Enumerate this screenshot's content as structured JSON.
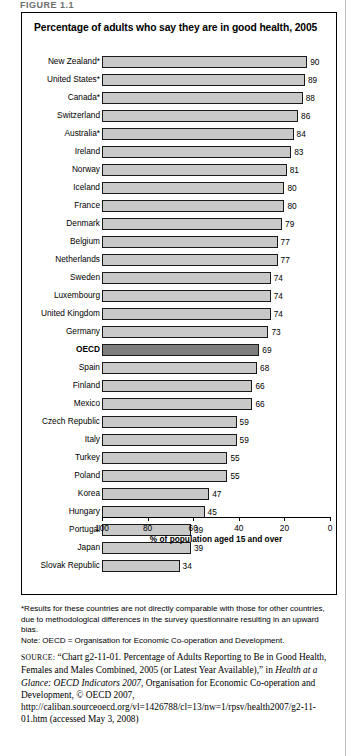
{
  "figure_label": "FIGURE 1.1",
  "panel": {
    "title": "Percentage of adults who say they are in good health, 2005"
  },
  "notes": {
    "asterisk_note": "*Results for these countries are not directly comparable with those for other countries, due to methodological differences in the survey questionnaire resulting in an upward bias.",
    "oecd_note": "Note: OECD = Organisation for Economic Co-operation and Development."
  },
  "source": {
    "lead": "SOURCE:",
    "part1": " “Chart g2-11-01. Percentage of Adults Reporting to Be in Good Health, Females and Males Combined, 2005 (or Latest Year Available),” in ",
    "italic_title": "Health at a Glance: OECD Indicators 2007",
    "part2": ", Organisation for Economic Co-operation and Development, © OECD 2007, http://caliban.sourceoecd.org/vl=1426788/cl=13/nw=1/rpsv/health2007/g2-11-01.htm (accessed May 3, 2008)"
  },
  "chart_data": {
    "type": "bar",
    "orientation": "horizontal",
    "title": "Percentage of adults who say they are in good health, 2005",
    "xlabel": "% of population aged 15 and over",
    "ylabel": "",
    "xlim": [
      100,
      0
    ],
    "axis_reversed": true,
    "ticks": [
      100,
      80,
      60,
      40,
      20,
      0
    ],
    "grid": false,
    "legend": "none",
    "highlight_category": "OECD",
    "colors": {
      "bar": "#c9c9c9",
      "bar_highlight": "#7d7d7d",
      "bar_outline": "#1a1a1a"
    },
    "categories": [
      "New Zealand*",
      "United States*",
      "Canada*",
      "Switzerland",
      "Australia*",
      "Ireland",
      "Norway",
      "Iceland",
      "France",
      "Denmark",
      "Belgium",
      "Netherlands",
      "Sweden",
      "Luxembourg",
      "United Kingdom",
      "Germany",
      "OECD",
      "Spain",
      "Finland",
      "Mexico",
      "Czech Republic",
      "Italy",
      "Turkey",
      "Poland",
      "Korea",
      "Hungary",
      "Portugal",
      "Japan",
      "Slovak Republic"
    ],
    "values": [
      90,
      89,
      88,
      86,
      84,
      83,
      81,
      80,
      80,
      79,
      77,
      77,
      74,
      74,
      74,
      73,
      69,
      68,
      66,
      66,
      59,
      59,
      55,
      55,
      47,
      45,
      39,
      39,
      34
    ]
  }
}
